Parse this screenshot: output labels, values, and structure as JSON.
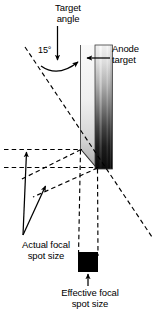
{
  "figure": {
    "labels": {
      "target_angle": "Target\nangle",
      "angle_value": "15°",
      "anode_target": "Anode\ntarget",
      "actual_focal_spot": "Actual focal\nspot size",
      "effective_focal_spot": "Effective focal\nspot size"
    },
    "colors": {
      "background": "#ffffff",
      "stroke": "#000000",
      "text": "#000000",
      "anode_face_light": "#f2f2f2",
      "anode_face_mid": "#c9c9c9",
      "anode_bar_light": "#e8e8e8",
      "anode_bar_dark": "#0b0b0b",
      "focal_spot_fill": "#000000"
    },
    "geometry": {
      "target_angle_degrees": 15,
      "anode_face_left_x": 80,
      "anode_face_right_x": 95,
      "anode_bar_left_x": 95,
      "anode_bar_right_x": 112,
      "anode_top_y": 45,
      "anode_bottom_y": 170,
      "bevel_top_point": [
        81,
        149
      ],
      "bevel_bottom_point": [
        97,
        168
      ],
      "focal_spot_rect": [
        78,
        252,
        20,
        20
      ],
      "diagonal_start": [
        25,
        48
      ],
      "diagonal_end": [
        152,
        237
      ],
      "horizontal_line_upper_y": 149,
      "horizontal_line_lower_y": 167
    }
  }
}
